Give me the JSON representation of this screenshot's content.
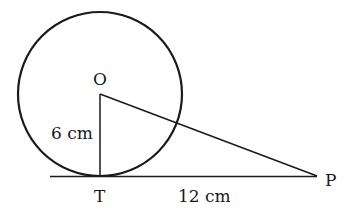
{
  "diagram": {
    "type": "geometry-tangent",
    "colors": {
      "stroke": "#1a1a1a",
      "background": "#ffffff"
    },
    "points": {
      "O": {
        "label": "O",
        "x": 100,
        "y": 94
      },
      "T": {
        "label": "T",
        "x": 100,
        "y": 176
      },
      "P": {
        "label": "P",
        "x": 317,
        "y": 176
      }
    },
    "circle": {
      "center": "O",
      "radius_px": 82
    },
    "segments": [
      {
        "from": "O",
        "to": "T",
        "label": "6 cm"
      },
      {
        "from": "T",
        "to": "P",
        "label": "12 cm"
      },
      {
        "from": "O",
        "to": "P",
        "label": ""
      }
    ],
    "labels": {
      "O": "O",
      "T": "T",
      "P": "P",
      "OT": "6 cm",
      "TP": "12 cm"
    }
  }
}
